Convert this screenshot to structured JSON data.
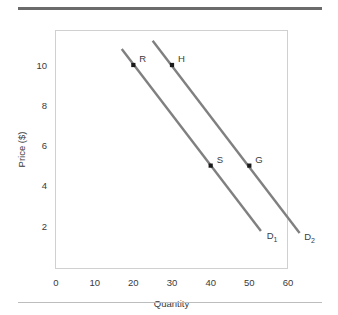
{
  "chart_data": {
    "type": "line",
    "title": "",
    "xlabel": "Quantity",
    "ylabel": "Price ($)",
    "xlim": [
      0,
      66
    ],
    "ylim": [
      0,
      11.8
    ],
    "xticks": [
      0,
      10,
      20,
      30,
      40,
      50,
      60
    ],
    "xticklabels": [
      "0",
      "10",
      "20",
      "30",
      "40",
      "50",
      "60"
    ],
    "yticks": [
      2,
      4,
      6,
      8,
      10
    ],
    "yticklabels": [
      "2",
      "4",
      "6",
      "8",
      "10"
    ],
    "grid": false,
    "legend": "none",
    "line_color": "#808080",
    "marker_color": "#1a1a1a",
    "frame_color": "#d0d0d0",
    "series": [
      {
        "name": "D1",
        "label": "D",
        "subscript": "1",
        "x": [
          17,
          53
        ],
        "y": [
          10.8,
          1.75
        ],
        "label_x": 54.5,
        "label_y": 1.35
      },
      {
        "name": "D2",
        "label": "D",
        "subscript": "2",
        "x": [
          25,
          63
        ],
        "y": [
          11.2,
          1.65
        ],
        "label_x": 64.2,
        "label_y": 1.3
      }
    ],
    "points": [
      {
        "label": "R",
        "x": 20,
        "y": 10,
        "series": "D1",
        "label_dx": 6,
        "label_dy": -3
      },
      {
        "label": "H",
        "x": 30,
        "y": 10,
        "series": "D2",
        "label_dx": 6,
        "label_dy": -3
      },
      {
        "label": "S",
        "x": 40,
        "y": 5,
        "series": "D1",
        "label_dx": 6,
        "label_dy": -3
      },
      {
        "label": "G",
        "x": 50,
        "y": 5,
        "series": "D2",
        "label_dx": 6,
        "label_dy": -3
      }
    ],
    "annotations": []
  },
  "figure": {
    "axis": {
      "x_title": "Quantity",
      "y_title": "Price ($)"
    }
  }
}
